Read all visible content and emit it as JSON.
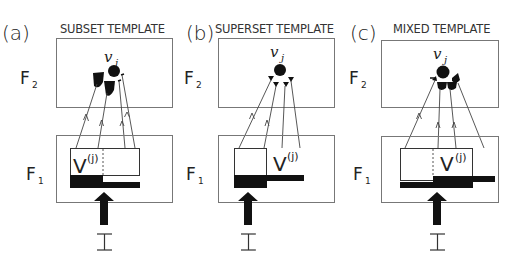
{
  "figure": {
    "panels": [
      {
        "id": "a",
        "panel_label": "(a)",
        "title": "SUBSET TEMPLATE",
        "node_label": "v",
        "node_subscript": "j",
        "layer_top": "F",
        "layer_top_sub": "2",
        "layer_bottom": "F",
        "layer_bottom_sub": "1",
        "template_label": "V",
        "template_sup": "(j)",
        "input_label": "I"
      },
      {
        "id": "b",
        "panel_label": "(b)",
        "title": "SUPERSET TEMPLATE",
        "node_label": "v",
        "node_subscript": "j",
        "layer_top": "F",
        "layer_top_sub": "2",
        "layer_bottom": "F",
        "layer_bottom_sub": "1",
        "template_label": "V",
        "template_sup": "(j)",
        "input_label": "I"
      },
      {
        "id": "c",
        "panel_label": "(c)",
        "title": "MIXED TEMPLATE",
        "node_label": "v",
        "node_subscript": "j",
        "layer_top": "F",
        "layer_top_sub": "2",
        "layer_bottom": "F",
        "layer_bottom_sub": "1",
        "template_label": "V",
        "template_sup": "(j)",
        "input_label": "I"
      }
    ],
    "colors": {
      "ink": "#222222",
      "frame": "#777777",
      "fill": "#111111",
      "background": "#ffffff"
    }
  }
}
